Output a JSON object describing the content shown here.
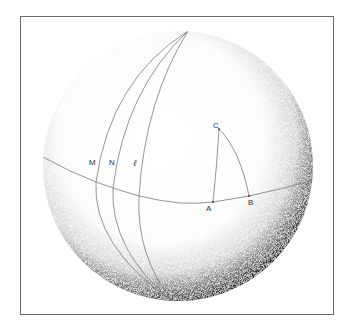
{
  "figure": {
    "labels": {
      "M": "M",
      "N": "N",
      "l": "ℓ",
      "A": "A",
      "B": "B",
      "C": "C"
    },
    "colors": {
      "line": "#7a7a7a",
      "shade": "#000000",
      "frame": "#6a6a6a",
      "background": "#ffffff"
    }
  }
}
